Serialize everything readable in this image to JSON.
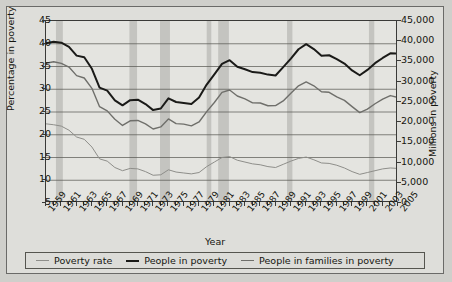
{
  "chart_data": {
    "type": "line",
    "title": "",
    "xlabel": "Year",
    "ylabel": "Percentage in poverty",
    "ylabel_right": "Millions in poverty",
    "grid": true,
    "legend_position": "bottom",
    "x": [
      1959,
      1960,
      1961,
      1962,
      1963,
      1964,
      1965,
      1966,
      1967,
      1968,
      1969,
      1970,
      1971,
      1972,
      1973,
      1974,
      1975,
      1976,
      1977,
      1978,
      1979,
      1980,
      1981,
      1982,
      1983,
      1984,
      1985,
      1986,
      1987,
      1988,
      1989,
      1990,
      1991,
      1992,
      1993,
      1994,
      1995,
      1996,
      1997,
      1998,
      1999,
      2000,
      2001,
      2002,
      2003,
      2004,
      2005
    ],
    "xtick_labels": [
      "1959",
      "1961",
      "1963",
      "1965",
      "1967",
      "1969",
      "1971",
      "1973",
      "1975",
      "1977",
      "1979",
      "1981",
      "1983",
      "1985",
      "1987",
      "1989",
      "1991",
      "1993",
      "1995",
      "1997",
      "1999",
      "2001",
      "2003",
      "2005"
    ],
    "xlim": [
      1959,
      2005
    ],
    "ylim_left": [
      5,
      45
    ],
    "ytick_labels_left": [
      "5",
      "10",
      "15",
      "20",
      "25",
      "30",
      "35",
      "40",
      "45"
    ],
    "ytick_values_left": [
      5,
      10,
      15,
      20,
      25,
      30,
      35,
      40,
      45
    ],
    "ylim_right": [
      0,
      45000
    ],
    "ytick_labels_right": [
      "0",
      "5,000",
      "10,000",
      "15,000",
      "20,000",
      "25,000",
      "30,000",
      "35,000",
      "40,000",
      "45,000"
    ],
    "ytick_values_right": [
      0,
      5000,
      10000,
      15000,
      20000,
      25000,
      30000,
      35000,
      40000,
      45000
    ],
    "recession_bands": [
      {
        "start": 1960.3,
        "end": 1961.2
      },
      {
        "start": 1969.9,
        "end": 1970.9
      },
      {
        "start": 1973.9,
        "end": 1975.2
      },
      {
        "start": 1980.0,
        "end": 1980.6
      },
      {
        "start": 1981.5,
        "end": 1982.9
      },
      {
        "start": 1990.5,
        "end": 1991.2
      },
      {
        "start": 2001.2,
        "end": 2001.9
      }
    ],
    "series": [
      {
        "name": "Poverty rate",
        "axis": "left",
        "color": "#8e8e8a",
        "width": 1.0,
        "values": [
          22.4,
          22.2,
          21.9,
          21.0,
          19.5,
          19.0,
          17.3,
          14.7,
          14.2,
          12.8,
          12.1,
          12.6,
          12.5,
          11.9,
          11.1,
          11.2,
          12.3,
          11.8,
          11.6,
          11.4,
          11.7,
          13.0,
          14.0,
          15.0,
          15.2,
          14.4,
          14.0,
          13.6,
          13.4,
          13.0,
          12.8,
          13.5,
          14.2,
          14.8,
          15.1,
          14.5,
          13.8,
          13.7,
          13.3,
          12.7,
          11.9,
          11.3,
          11.7,
          12.1,
          12.5,
          12.7,
          12.6
        ]
      },
      {
        "name": "People in poverty",
        "axis": "right",
        "color": "#1a1a18",
        "width": 2.0,
        "values": [
          39490,
          39851,
          39628,
          38625,
          36436,
          36055,
          33185,
          28510,
          27769,
          25389,
          24147,
          25420,
          25559,
          24460,
          22973,
          23370,
          25877,
          24975,
          24720,
          24497,
          26072,
          29272,
          31822,
          34398,
          35303,
          33700,
          33064,
          32370,
          32221,
          31745,
          31528,
          33585,
          35708,
          38014,
          39265,
          38059,
          36425,
          36529,
          35574,
          34476,
          32791,
          31581,
          32907,
          34570,
          35861,
          36997,
          36950
        ]
      },
      {
        "name": "People in families in poverty",
        "axis": "right",
        "color": "#6f6f6b",
        "width": 1.4,
        "values": [
          34562,
          34925,
          34509,
          33623,
          31498,
          30912,
          28358,
          23809,
          22771,
          20695,
          19175,
          20330,
          20405,
          19577,
          18299,
          18817,
          20789,
          19632,
          19505,
          19062,
          20032,
          22601,
          24850,
          27349,
          27933,
          26458,
          25729,
          24754,
          24725,
          24048,
          24066,
          25232,
          27143,
          28961,
          29927,
          28985,
          27501,
          27376,
          26217,
          25370,
          23830,
          22347,
          23215,
          24534,
          25684,
          26564,
          26068
        ]
      }
    ]
  },
  "axes": {
    "left_title": "Percentage in poverty",
    "right_title": "Millions in poverty",
    "x_title": "Year"
  },
  "legend": {
    "items": [
      {
        "label": "Poverty rate",
        "color": "#8e8e8a"
      },
      {
        "label": "People in poverty",
        "color": "#1a1a18"
      },
      {
        "label": "People in families in poverty",
        "color": "#6f6f6b"
      }
    ]
  }
}
